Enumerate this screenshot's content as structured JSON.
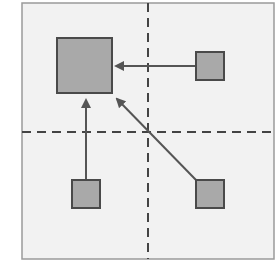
{
  "diagram": {
    "colors": {
      "background": "#ffffff",
      "panel_fill": "#f2f2f2",
      "panel_border": "#9a9a9a",
      "divider": "#444444",
      "box_fill": "#a9a9a9",
      "box_border": "#4a4a4a",
      "arrow": "#555555"
    },
    "panel": {
      "x": 22,
      "y": 3,
      "width": 252,
      "height": 256
    },
    "dividers": {
      "vertical_x": 148,
      "horizontal_y": 132
    },
    "boxes": [
      {
        "id": "target-large",
        "x": 57,
        "y": 38,
        "size": 55
      },
      {
        "id": "source-top-right",
        "x": 196,
        "y": 52,
        "size": 28
      },
      {
        "id": "source-bottom-left",
        "x": 72,
        "y": 180,
        "size": 28
      },
      {
        "id": "source-bottom-right",
        "x": 196,
        "y": 180,
        "size": 28
      }
    ],
    "arrows": [
      {
        "from": "source-top-right",
        "x1": 196,
        "y1": 66,
        "x2": 116,
        "y2": 66
      },
      {
        "from": "source-bottom-left",
        "x1": 86,
        "y1": 180,
        "x2": 86,
        "y2": 100
      },
      {
        "from": "source-bottom-right",
        "x1": 196,
        "y1": 180,
        "x2": 117,
        "y2": 99
      }
    ]
  }
}
